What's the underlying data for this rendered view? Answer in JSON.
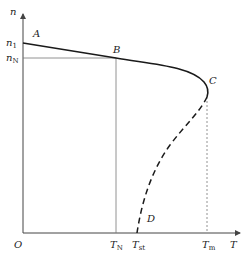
{
  "axes": {
    "y_label": "n",
    "x_label": "T",
    "origin": "O"
  },
  "y_ticks": [
    {
      "main": "n",
      "sub": "1"
    },
    {
      "main": "n",
      "sub": "N"
    }
  ],
  "x_ticks": [
    {
      "main": "T",
      "sub": "N"
    },
    {
      "main": "T",
      "sub": "st"
    },
    {
      "main": "T",
      "sub": "m"
    }
  ],
  "points": {
    "A": "A",
    "B": "B",
    "C": "C",
    "D": "D"
  },
  "colors": {
    "curve": "#1a1a1a",
    "axis": "#444444",
    "guide": "#777777"
  }
}
